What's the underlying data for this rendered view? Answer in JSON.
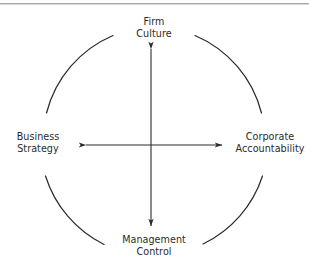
{
  "figure": {
    "title": "",
    "has_top_rule": true,
    "background_color": "#ffffff",
    "stroke_color": "#2b2b2b",
    "text_color": "#2b2b2b"
  },
  "diagram": {
    "type": "circular-four-node-framework",
    "shape": "circle",
    "center": {
      "x": 154,
      "y": 143
    },
    "radius": 115,
    "nodes": [
      {
        "id": "firm-culture",
        "position": "top",
        "lines": [
          "Firm",
          "Culture"
        ]
      },
      {
        "id": "corporate-accountability",
        "position": "right",
        "lines": [
          "Corporate",
          "Accountability"
        ]
      },
      {
        "id": "management-control",
        "position": "bottom",
        "lines": [
          "Management",
          "Control"
        ]
      },
      {
        "id": "business-strategy",
        "position": "left",
        "lines": [
          "Business",
          "Strategy"
        ]
      }
    ],
    "connectors": [
      {
        "id": "horizontal-axis",
        "orientation": "horizontal",
        "arrowheads": "both",
        "from": "business-strategy",
        "to": "corporate-accountability"
      },
      {
        "id": "vertical-axis",
        "orientation": "vertical",
        "arrowheads": "both",
        "from": "firm-culture",
        "to": "management-control"
      }
    ]
  }
}
